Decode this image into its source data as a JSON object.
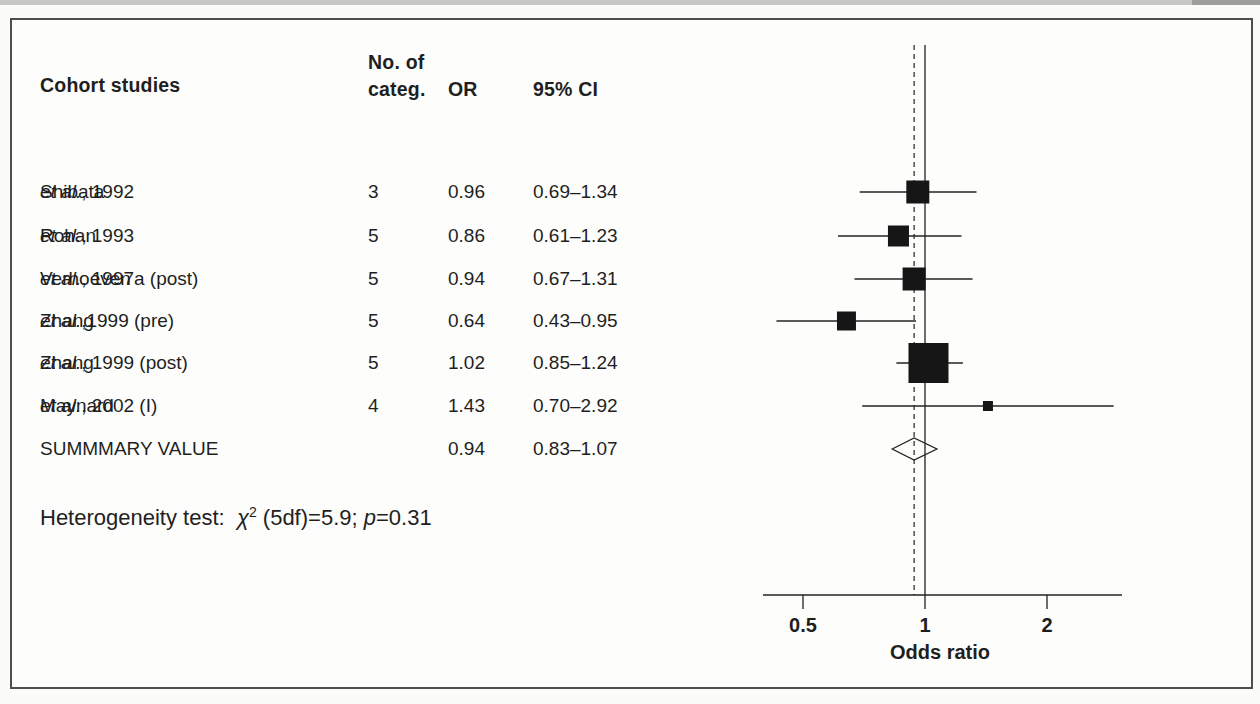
{
  "colors": {
    "ink": "#232323",
    "marker": "#161616",
    "frame": "#4e4e4e",
    "scan_band": "#c7c7c3"
  },
  "figure": {
    "header": {
      "col_study": "Cohort studies",
      "col_categ_line1": "No. of",
      "col_categ_line2": "categ.",
      "col_or": "OR",
      "col_ci": "95% CI"
    },
    "heterogeneity": {
      "prefix": "Heterogeneity test:  ",
      "chi": "χ",
      "exponent": "2",
      "mid": " (5df)=5.9; ",
      "p": "p",
      "suffix": "=0.31"
    }
  },
  "chart_data": {
    "type": "forest",
    "title": "",
    "xlabel": "Odds ratio",
    "x_scale": "log",
    "x_ticks": [
      "0.5",
      "1",
      "2"
    ],
    "x_tick_values": [
      0.5,
      1,
      2
    ],
    "x_range": [
      0.4,
      3.2
    ],
    "reference_line": 1.0,
    "summary_line": 0.94,
    "heterogeneity": "Heterogeneity test: χ2 (5df)=5.9; p=0.31",
    "studies": [
      {
        "name_pre": "Shibata ",
        "name_italic": "et al.",
        "name_post": ", 1992",
        "categories": "3",
        "or": 0.96,
        "or_text": "0.96",
        "ci_low": 0.69,
        "ci_high": 1.34,
        "ci_text": "0.69–1.34",
        "marker_px": 23
      },
      {
        "name_pre": "Rohan ",
        "name_italic": "et al.",
        "name_post": ", 1993",
        "categories": "5",
        "or": 0.86,
        "or_text": "0.86",
        "ci_low": 0.61,
        "ci_high": 1.23,
        "ci_text": "0.61–1.23",
        "marker_px": 21
      },
      {
        "name_pre": "Verhoeven ",
        "name_italic": "et al.",
        "name_post": ", 1997a (post)",
        "categories": "5",
        "or": 0.94,
        "or_text": "0.94",
        "ci_low": 0.67,
        "ci_high": 1.31,
        "ci_text": "0.67–1.31",
        "marker_px": 23
      },
      {
        "name_pre": "Zhang ",
        "name_italic": "et al.",
        "name_post": ",1999 (pre)",
        "categories": "5",
        "or": 0.64,
        "or_text": "0.64",
        "ci_low": 0.43,
        "ci_high": 0.95,
        "ci_text": "0.43–0.95",
        "marker_px": 19
      },
      {
        "name_pre": "Zhang ",
        "name_italic": "et al.",
        "name_post": ", 1999 (post)",
        "categories": "5",
        "or": 1.02,
        "or_text": "1.02",
        "ci_low": 0.85,
        "ci_high": 1.24,
        "ci_text": "0.85–1.24",
        "marker_px": 40
      },
      {
        "name_pre": "Maynard ",
        "name_italic": "et al.",
        "name_post": ", 2002 (I)",
        "categories": "4",
        "or": 1.43,
        "or_text": "1.43",
        "ci_low": 0.7,
        "ci_high": 2.92,
        "ci_text": "0.70–2.92",
        "marker_px": 10
      }
    ],
    "summary": {
      "label": "SUMMMARY VALUE",
      "or": 0.94,
      "or_text": "0.94",
      "ci_low": 0.83,
      "ci_high": 1.07,
      "ci_text": "0.83–1.07"
    }
  }
}
